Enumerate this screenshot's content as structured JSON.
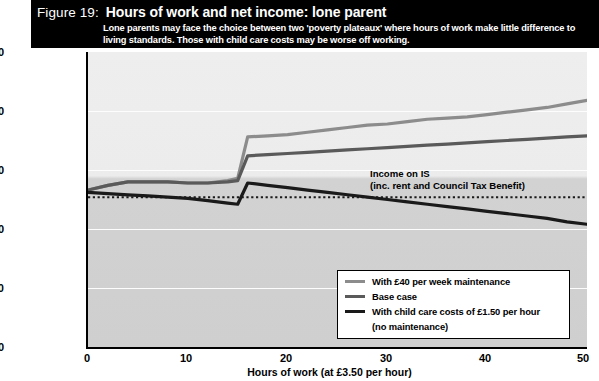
{
  "figure": {
    "number": "Figure 19:",
    "title": "Hours of work and net income: lone parent",
    "subtitle": "Lone parents may face the choice between two 'poverty plateaux' where hours of work make little difference to living standards. Those with child care costs may be worse off working."
  },
  "annotation": {
    "line1": "Income on IS",
    "line2": "(inc. rent and Council Tax Benefit)"
  },
  "legend": {
    "items": [
      {
        "label": "With £40 per week maintenance",
        "color": "#8c8c8c"
      },
      {
        "label": "Base case",
        "color": "#5a5a5a"
      },
      {
        "label": "With child care costs of £1.50 per hour",
        "color": "#1a1a1a"
      },
      {
        "label": "(no maintenance)",
        "color": ""
      }
    ]
  },
  "colors": {
    "banner_bg": "#000000",
    "banner_text": "#ffffff",
    "plot_bg_upper": "#ececec",
    "plot_bg_lower": "#cfcfcf",
    "gridline": "#fdfdfd",
    "axis": "#000000",
    "is_line": "#1a1a1a"
  },
  "chart_data": {
    "type": "line",
    "title": "Hours of work and net income: lone parent",
    "xlabel": "Hours of work (at £3.50 per hour)",
    "ylabel": "Net income (£ per week)",
    "xlim": [
      0,
      50
    ],
    "ylim": [
      0,
      250
    ],
    "xticks": [
      0,
      10,
      20,
      30,
      40,
      50
    ],
    "yticks": [
      0,
      50,
      100,
      150,
      200,
      250
    ],
    "grid": true,
    "legend_position": "lower-right",
    "reference_lines": [
      {
        "name": "Income on IS (inc. rent and Council Tax Benefit)",
        "style": "dotted",
        "y": 127
      }
    ],
    "x": [
      0,
      2,
      4,
      6,
      8,
      10,
      12,
      14,
      15,
      16,
      18,
      20,
      22,
      24,
      26,
      28,
      30,
      32,
      34,
      36,
      38,
      40,
      42,
      44,
      46,
      48,
      50
    ],
    "series": [
      {
        "name": "With £40 per week maintenance",
        "color": "#8c8c8c",
        "values": [
          133,
          137,
          140,
          140,
          140,
          139,
          139,
          141,
          143,
          178,
          179,
          180,
          182,
          184,
          186,
          188,
          189,
          191,
          193,
          194,
          195,
          197,
          199,
          201,
          203,
          206,
          209
        ]
      },
      {
        "name": "Base case",
        "color": "#5a5a5a",
        "values": [
          133,
          137,
          140,
          140,
          140,
          139,
          139,
          140,
          141,
          162,
          163,
          164,
          165,
          166,
          167,
          168,
          169,
          170,
          171,
          172,
          173,
          174,
          175,
          176,
          177,
          178,
          179
        ]
      },
      {
        "name": "With child care costs of £1.50 per hour (no maintenance)",
        "color": "#1a1a1a",
        "values": [
          131,
          130,
          129,
          128,
          127,
          126,
          124,
          122,
          121,
          139,
          137,
          135,
          133,
          131,
          129,
          127,
          125,
          123,
          121,
          119,
          117,
          115,
          113,
          111,
          109,
          106,
          104
        ]
      }
    ]
  }
}
